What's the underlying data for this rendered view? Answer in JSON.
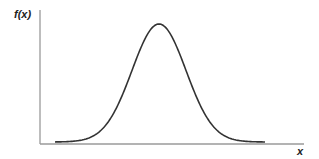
{
  "chart_data": {
    "type": "line",
    "title": "",
    "xlabel": "x",
    "ylabel": "f(x)",
    "grid": false,
    "legend": null,
    "series": [
      {
        "name": "f(x)",
        "shape": "normal",
        "x": [
          -3.0,
          -2.5,
          -2.0,
          -1.5,
          -1.0,
          -0.5,
          0.0,
          0.5,
          1.0,
          1.5,
          2.0,
          2.5,
          3.0
        ],
        "values": [
          0.011,
          0.044,
          0.135,
          0.325,
          0.607,
          0.882,
          1.0,
          0.882,
          0.607,
          0.325,
          0.135,
          0.044,
          0.011
        ]
      }
    ],
    "xlim": [
      -3.5,
      4.2
    ],
    "ylim": [
      0,
      1.1
    ],
    "ticks": false
  },
  "labels": {
    "y_axis": "f(x)",
    "x_axis": "x"
  },
  "colors": {
    "curve": "#333333",
    "axis": "#999999",
    "text": "#222222"
  }
}
